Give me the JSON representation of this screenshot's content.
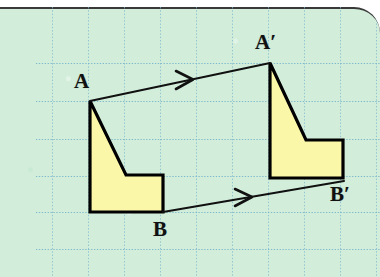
{
  "figure": {
    "background_color": "#d2eedb",
    "grid_color": "#7fb9cf",
    "shape_fill": "#fbf7a8",
    "shape_stroke": "#000000",
    "arrow_color": "#111111",
    "border_color": "#3a3a3a"
  },
  "grid": {
    "vertical_lines_x": [
      52,
      88,
      124,
      160,
      196,
      232,
      268,
      304,
      340,
      376
    ],
    "horizontal_lines_y": [
      63,
      101,
      139,
      176,
      212,
      249
    ],
    "spacing_px": 36,
    "style": "dotted"
  },
  "labels": {
    "a": "A",
    "a_prime": "A′",
    "b": "B",
    "b_prime": "B′"
  },
  "shapes": {
    "preimage": {
      "name": "preimage-polygon",
      "points": "90,101 90,212 163,212 163,175 126,175",
      "vertices": [
        {
          "name": "A",
          "x": 90,
          "y": 101
        },
        {
          "name": "bottom-left",
          "x": 90,
          "y": 212
        },
        {
          "name": "B",
          "x": 163,
          "y": 212
        },
        {
          "name": "right-top",
          "x": 163,
          "y": 175
        },
        {
          "name": "notch",
          "x": 126,
          "y": 175
        }
      ]
    },
    "image": {
      "name": "image-polygon",
      "points": "270,63 270,178 343,178 343,140 306,140",
      "vertices": [
        {
          "name": "A'",
          "x": 270,
          "y": 63
        },
        {
          "name": "bottom-left",
          "x": 270,
          "y": 178
        },
        {
          "name": "B'",
          "x": 343,
          "y": 178
        },
        {
          "name": "right-top",
          "x": 343,
          "y": 140
        },
        {
          "name": "notch",
          "x": 306,
          "y": 140
        }
      ]
    }
  },
  "arrows": [
    {
      "name": "translation-vector-a",
      "from": {
        "label": "A",
        "x": 90,
        "y": 101
      },
      "to": {
        "label": "A′",
        "x": 270,
        "y": 63
      },
      "arrowhead_at": {
        "x": 190,
        "y": 80
      }
    },
    {
      "name": "translation-vector-b",
      "from": {
        "label": "B",
        "x": 163,
        "y": 212
      },
      "to": {
        "label": "B′",
        "x": 343,
        "y": 181
      },
      "arrowhead_at": {
        "x": 249,
        "y": 197
      }
    }
  ],
  "label_positions": {
    "a": {
      "x": 74,
      "y": 73
    },
    "a_prime": {
      "x": 255,
      "y": 34
    },
    "b": {
      "x": 152,
      "y": 220
    },
    "b_prime": {
      "x": 331,
      "y": 186
    }
  }
}
